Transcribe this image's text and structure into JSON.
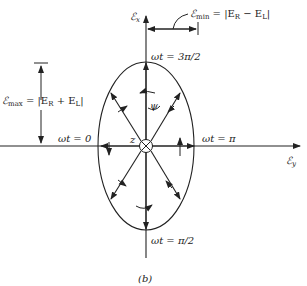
{
  "diagram": {
    "caption": "(b)",
    "axes": {
      "vertical_label": "ℰ",
      "vertical_sub": "x",
      "horizontal_label": "ℰ",
      "horizontal_sub": "y",
      "origin_label": "z"
    },
    "phase_labels": {
      "top": "ωt = 3π/2",
      "left": "ωt = 0",
      "right": "ωt = π",
      "bottom": "ωt = π/2"
    },
    "annotations": {
      "emin_sym": "ℰ",
      "emin_sub": "min",
      "emin_eq": " = |E",
      "emin_r": "R",
      "emin_mid": " − E",
      "emin_l": "L",
      "emin_end": "|",
      "emax_sym": "ℰ",
      "emax_sub": "max",
      "emax_eq": " = |E",
      "emax_r": "R",
      "emax_mid": " + E",
      "emax_l": "L",
      "emax_end": "|",
      "angle": "ψ"
    },
    "colors": {
      "ink": "#222222",
      "background": "#ffffff"
    }
  }
}
